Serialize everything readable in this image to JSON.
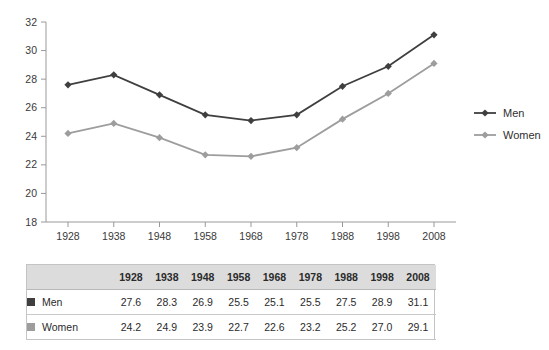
{
  "chart_data": {
    "type": "line",
    "title": "",
    "subtitle": "",
    "xlabel": "",
    "ylabel": "",
    "categories": [
      "1928",
      "1938",
      "1948",
      "1958",
      "1968",
      "1978",
      "1988",
      "1998",
      "2008"
    ],
    "x": [
      1928,
      1938,
      1948,
      1958,
      1968,
      1978,
      1988,
      1998,
      2008
    ],
    "ylim": [
      18,
      32
    ],
    "yticks": [
      "18",
      "20",
      "22",
      "24",
      "26",
      "28",
      "30",
      "32"
    ],
    "ytick_values": [
      18,
      20,
      22,
      24,
      26,
      28,
      30,
      32
    ],
    "grid": false,
    "legend_position": "right",
    "series": [
      {
        "name": "Men",
        "color": "#3f3f3f",
        "marker": "diamond",
        "values": [
          27.6,
          28.3,
          26.9,
          25.5,
          25.1,
          25.5,
          27.5,
          28.9,
          31.1
        ],
        "labels": [
          "27.6",
          "28.3",
          "26.9",
          "25.5",
          "25.1",
          "25.5",
          "27.5",
          "28.9",
          "31.1"
        ]
      },
      {
        "name": "Women",
        "color": "#9d9d9d",
        "marker": "diamond",
        "values": [
          24.2,
          24.9,
          23.9,
          22.7,
          22.6,
          23.2,
          25.2,
          27.0,
          29.1
        ],
        "labels": [
          "24.2",
          "24.9",
          "23.9",
          "22.7",
          "22.6",
          "23.2",
          "25.2",
          "27.0",
          "29.1"
        ]
      }
    ]
  },
  "legend": {
    "items": [
      {
        "label": "Men",
        "color": "#3f3f3f"
      },
      {
        "label": "Women",
        "color": "#9d9d9d"
      }
    ]
  },
  "table": {
    "corner_header": "",
    "column_headers": [
      "1928",
      "1938",
      "1948",
      "1958",
      "1968",
      "1978",
      "1988",
      "1998",
      "2008"
    ],
    "rows": [
      {
        "label": "Men",
        "color": "#3f3f3f",
        "values": [
          "27.6",
          "28.3",
          "26.9",
          "25.5",
          "25.1",
          "25.5",
          "27.5",
          "28.9",
          "31.1"
        ]
      },
      {
        "label": "Women",
        "color": "#9d9d9d",
        "values": [
          "24.2",
          "24.9",
          "23.9",
          "22.7",
          "22.6",
          "23.2",
          "25.2",
          "27.0",
          "29.1"
        ]
      }
    ]
  },
  "axis": {
    "y_labels": [
      "32",
      "30",
      "28",
      "26",
      "24",
      "22",
      "20",
      "18"
    ],
    "x_labels": [
      "1928",
      "1938",
      "1948",
      "1958",
      "1968",
      "1978",
      "1988",
      "1998",
      "2008"
    ]
  }
}
